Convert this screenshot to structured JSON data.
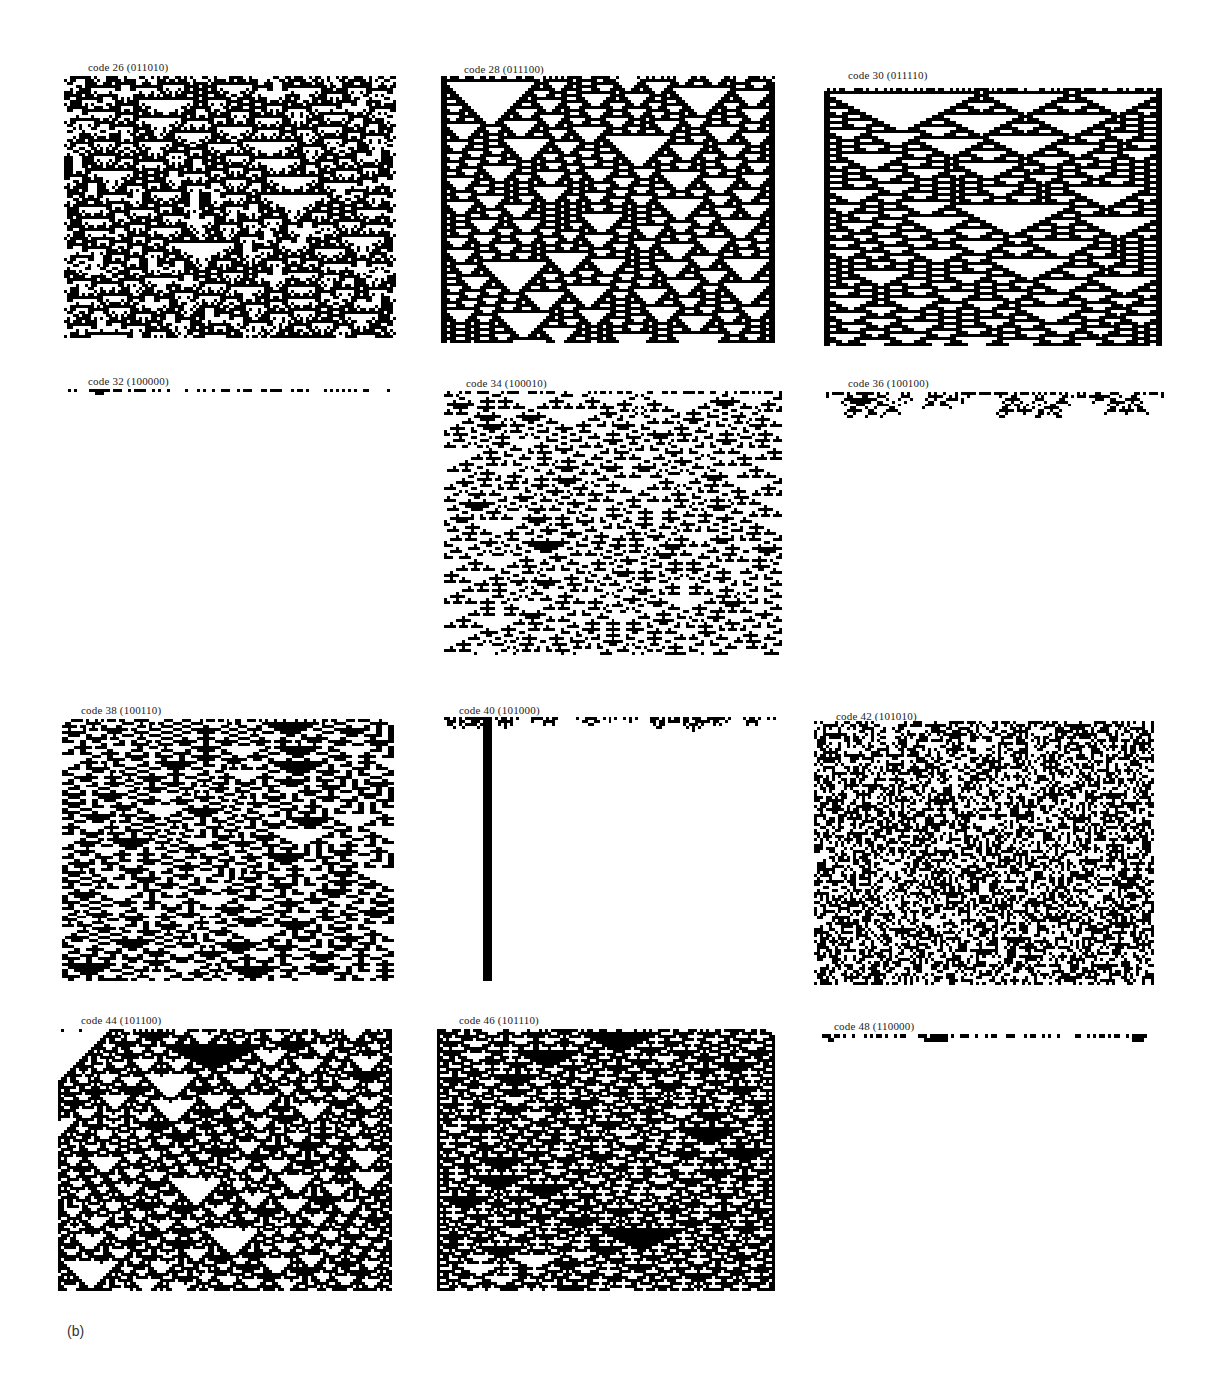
{
  "header": {
    "cut_heading": ""
  },
  "figure_label": "(b)",
  "panels": [
    {
      "code": 26,
      "label": "code 26 (011010)",
      "binary": "011010",
      "x": 64,
      "y": 76,
      "w": 332,
      "h": 262,
      "label_x": 88,
      "label_y": 61,
      "rows": 88,
      "dies": false
    },
    {
      "code": 28,
      "label": "code 28 (011100)",
      "binary": "011100",
      "x": 441,
      "y": 76,
      "w": 334,
      "h": 267,
      "label_x": 464,
      "label_y": 63,
      "rows": 89,
      "dies": false
    },
    {
      "code": 30,
      "label": "code 30 (011110)",
      "binary": "011110",
      "x": 824,
      "y": 88,
      "w": 338,
      "h": 258,
      "label_x": 848,
      "label_y": 69,
      "rows": 86,
      "dies": false
    },
    {
      "code": 32,
      "label": "code 32 (100000)",
      "binary": "100000",
      "x": 68,
      "y": 389,
      "w": 328,
      "h": 6,
      "label_x": 88,
      "label_y": 375,
      "rows": 2,
      "dies": true
    },
    {
      "code": 34,
      "label": "code 34 (100010)",
      "binary": "100010",
      "x": 444,
      "y": 391,
      "w": 338,
      "h": 264,
      "label_x": 466,
      "label_y": 377,
      "rows": 88,
      "dies": false
    },
    {
      "code": 36,
      "label": "code 36 (100100)",
      "binary": "100100",
      "x": 826,
      "y": 392,
      "w": 338,
      "h": 26,
      "label_x": 848,
      "label_y": 377,
      "rows": 9,
      "dies": true
    },
    {
      "code": 38,
      "label": "code 38 (100110)",
      "binary": "100110",
      "x": 62,
      "y": 719,
      "w": 332,
      "h": 262,
      "label_x": 81,
      "label_y": 704,
      "rows": 88,
      "dies": false
    },
    {
      "code": 40,
      "label": "code 40 (101000)",
      "binary": "101000",
      "x": 444,
      "y": 717,
      "w": 332,
      "h": 264,
      "label_x": 459,
      "label_y": 704,
      "rows": 88,
      "dies": true
    },
    {
      "code": 42,
      "label": "code 42 (101010)",
      "binary": "101010",
      "x": 814,
      "y": 721,
      "w": 340,
      "h": 264,
      "label_x": 836,
      "label_y": 710,
      "rows": 88,
      "dies": false
    },
    {
      "code": 44,
      "label": "code 44 (101100)",
      "binary": "101100",
      "x": 58,
      "y": 1029,
      "w": 334,
      "h": 262,
      "label_x": 81,
      "label_y": 1014,
      "rows": 88,
      "dies": false
    },
    {
      "code": 46,
      "label": "code 46 (101110)",
      "binary": "101110",
      "x": 437,
      "y": 1029,
      "w": 338,
      "h": 262,
      "label_x": 459,
      "label_y": 1014,
      "rows": 88,
      "dies": false
    },
    {
      "code": 48,
      "label": "code 48 (110000)",
      "binary": "110000",
      "x": 816,
      "y": 1034,
      "w": 334,
      "h": 8,
      "label_x": 834,
      "label_y": 1020,
      "rows": 2,
      "dies": true
    }
  ],
  "colors": {
    "cell_on": "#000000",
    "cell_off": "#ffffff",
    "label": "#222222"
  }
}
